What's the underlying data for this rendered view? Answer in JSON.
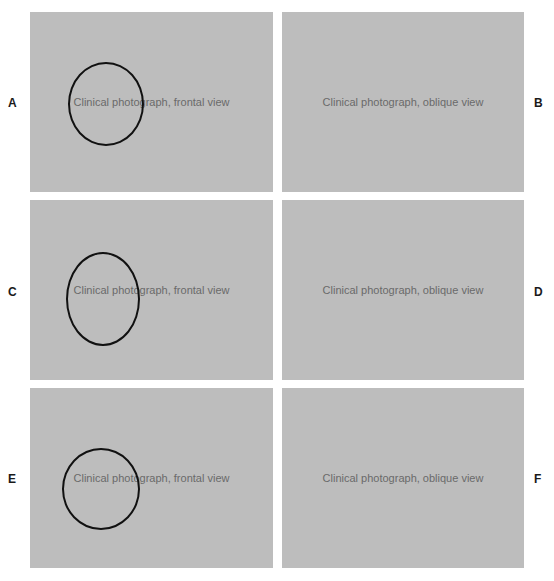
{
  "figure": {
    "panels": [
      {
        "label": "A",
        "description": "Clinical photograph, frontal view",
        "marker": "circle"
      },
      {
        "label": "B",
        "description": "Clinical photograph, oblique view",
        "marker": null
      },
      {
        "label": "C",
        "description": "Clinical photograph, frontal view",
        "marker": "circle"
      },
      {
        "label": "D",
        "description": "Clinical photograph, oblique view",
        "marker": null
      },
      {
        "label": "E",
        "description": "Clinical photograph, frontal view",
        "marker": "circle"
      },
      {
        "label": "F",
        "description": "Clinical photograph, oblique view",
        "marker": null
      }
    ]
  }
}
